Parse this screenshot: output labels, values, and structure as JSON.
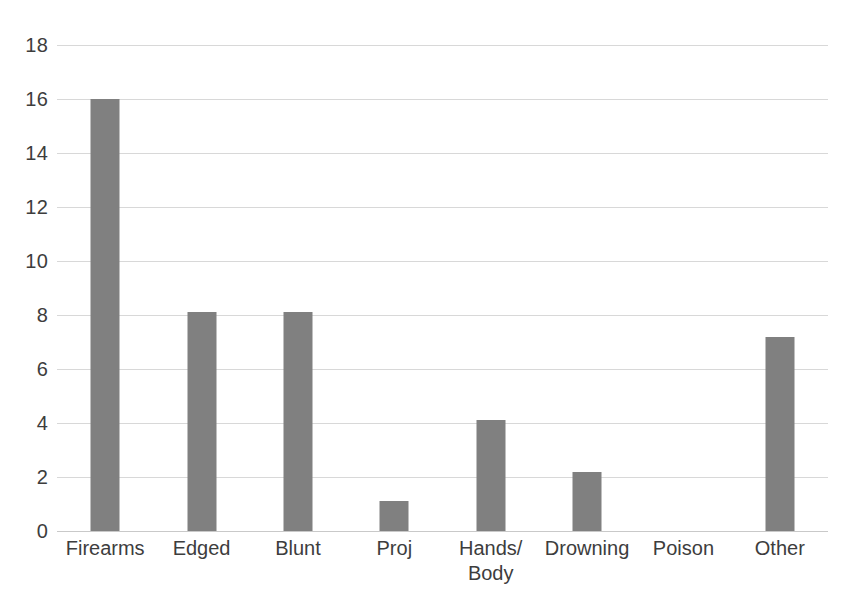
{
  "chart_data": {
    "type": "bar",
    "title": "",
    "subtitle": "",
    "xlabel": "",
    "ylabel": "",
    "categories": [
      "Firearms",
      "Edged",
      "Blunt",
      "Proj",
      "Hands/\nBody",
      "Drowning",
      "Poison",
      "Other"
    ],
    "values": [
      16,
      8.1,
      8.1,
      1.1,
      4.1,
      2.2,
      0,
      7.2
    ],
    "ylim": [
      0,
      18
    ],
    "ytick_values": [
      0,
      2,
      4,
      6,
      8,
      10,
      12,
      14,
      16,
      18
    ],
    "ytick_labels": [
      "0",
      "2",
      "4",
      "6",
      "8",
      "10",
      "12",
      "14",
      "16",
      "18"
    ],
    "grid": "horizontal",
    "legend": "none",
    "bar_color": "#808080",
    "gridline_color": "#d8d8d8",
    "background_color": "#ffffff",
    "annotations": []
  }
}
